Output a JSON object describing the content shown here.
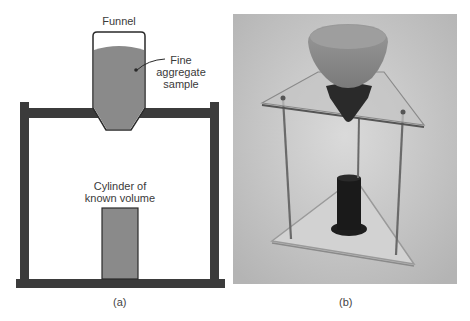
{
  "figure": {
    "panel_a": {
      "caption": "(a)",
      "labels": {
        "funnel": "Funnel",
        "sample_line1": "Fine",
        "sample_line2": "aggregate",
        "sample_line3": "sample",
        "cylinder_line1": "Cylinder of",
        "cylinder_line2": "known volume"
      },
      "colors": {
        "frame": "#3a3a3a",
        "fill": "#8a8a8a",
        "outline": "#2a2a2a"
      }
    },
    "panel_b": {
      "caption": "(b)",
      "description": "Photograph of funnel on triangular stand above a black cylinder",
      "colors": {
        "background": "#c8c8c8",
        "plate": "#d6d6d6",
        "rod": "#6a6a6a",
        "cylinder": "#1a1a1a"
      }
    }
  }
}
